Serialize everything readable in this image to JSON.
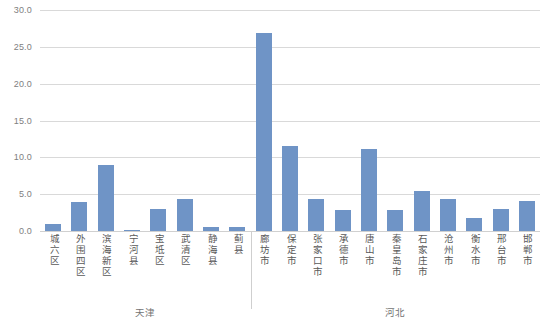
{
  "chart_data": {
    "type": "bar",
    "title": "",
    "subtitle": "",
    "xlabel": "",
    "ylabel": "",
    "ylim": [
      0.0,
      30.0
    ],
    "ytick_labels": [
      "0.0",
      "5.0",
      "10.0",
      "15.0",
      "20.0",
      "25.0",
      "30.0"
    ],
    "ytick_values": [
      0.0,
      5.0,
      10.0,
      15.0,
      20.0,
      25.0,
      30.0
    ],
    "grid": true,
    "legend": "none",
    "bar_color": "#6f94c6",
    "gridline_color": "#d9d9d9",
    "axis_text_color": "#808080",
    "categories": [
      "城六区",
      "外围四区",
      "滨海新区",
      "宁河县",
      "宝坻区",
      "武清区",
      "静海县",
      "蓟县",
      "廊坊市",
      "保定市",
      "张家口市",
      "承德市",
      "唐山市",
      "秦皇岛市",
      "石家庄市",
      "沧州市",
      "衡水市",
      "邢台市",
      "邯郸市"
    ],
    "values": [
      1.0,
      4.0,
      9.0,
      0.2,
      3.0,
      4.4,
      0.6,
      0.6,
      26.9,
      11.5,
      4.3,
      2.8,
      11.2,
      2.9,
      5.4,
      4.3,
      1.8,
      3.0,
      4.1
    ],
    "groups": [
      {
        "label": "天津",
        "start_index": 0,
        "end_index": 7
      },
      {
        "label": "河北",
        "start_index": 8,
        "end_index": 18
      }
    ]
  }
}
